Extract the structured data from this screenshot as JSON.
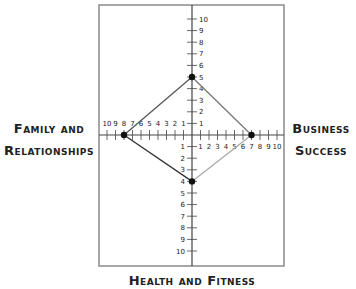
{
  "chart_data": {
    "type": "radar-quadrant",
    "title": "",
    "axes": [
      {
        "name": "Family and Relationships",
        "direction": "left",
        "value": 8
      },
      {
        "name": "Business Success",
        "direction": "right",
        "value": 7
      },
      {
        "name": "",
        "direction": "up",
        "value": 5
      },
      {
        "name": "Health and Fitness",
        "direction": "down",
        "value": 4
      }
    ],
    "points": [
      {
        "axis": "up",
        "value": 5
      },
      {
        "axis": "right",
        "value": 7
      },
      {
        "axis": "down",
        "value": 4
      },
      {
        "axis": "left",
        "value": 8
      }
    ],
    "tick_labels": [
      "1",
      "2",
      "3",
      "4",
      "5",
      "6",
      "7",
      "8",
      "9",
      "10"
    ],
    "axis_range": [
      0,
      10
    ],
    "grid": false,
    "line_colors": {
      "upper_left": "#555555",
      "upper_right": "#777777",
      "lower_right": "#aaaaaa",
      "lower_left": "#333333"
    }
  },
  "labels": {
    "left_line1": "Family and",
    "left_line2": "Relationships",
    "right_line1": "Business",
    "right_line2": "Success",
    "bottom": "Health and Fitness"
  },
  "colors": {
    "frame": "#8a8a8a",
    "axis": "#444444",
    "point": "#111111"
  }
}
